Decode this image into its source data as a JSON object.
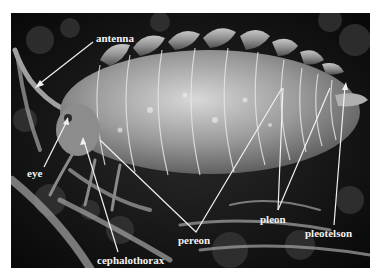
{
  "figure": {
    "colors": {
      "background": "#ffffff",
      "photo_dark": "#0d0d0d",
      "body_light": "#bdbdbd",
      "label": "#f2f2f2"
    },
    "labels": {
      "antenna": "antenna",
      "eye": "eye",
      "cephalothorax": "cephalothorax",
      "pereon": "pereon",
      "pleon": "pleon",
      "pleotelson": "pleotelson"
    }
  }
}
